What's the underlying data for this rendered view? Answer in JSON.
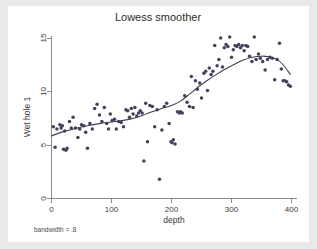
{
  "figure": {
    "title": "Lowess smoother",
    "note": "bandwidth = .8",
    "background": "#e9e9e9",
    "canvas_background": "#ffffff"
  },
  "chart_data": {
    "type": "scatter",
    "title": "Lowess smoother",
    "xlabel": "depth",
    "ylabel": "Wet hole 1",
    "note": "bandwidth = .8",
    "xlim": [
      0,
      400
    ],
    "ylim": [
      0,
      15.8
    ],
    "xticks": [
      0,
      100,
      200,
      300,
      400
    ],
    "yticks": [
      0,
      5,
      10,
      15
    ],
    "xtick_labels": [
      "0",
      "100",
      "200",
      "300",
      "400"
    ],
    "ytick_labels": [
      "0",
      "5",
      "10",
      "15"
    ],
    "grid": false,
    "legend": false,
    "marker_color": "#42425c",
    "line_color": "#3f3f55",
    "series": [
      {
        "name": "Wet hole 1 observations",
        "type": "scatter",
        "points": [
          [
            3,
            6.7
          ],
          [
            6,
            4.8
          ],
          [
            9,
            6.5
          ],
          [
            14,
            6.9
          ],
          [
            16,
            6.6
          ],
          [
            18,
            6.8
          ],
          [
            20,
            4.6
          ],
          [
            22,
            6.3
          ],
          [
            24,
            4.5
          ],
          [
            26,
            4.7
          ],
          [
            30,
            7.2
          ],
          [
            33,
            6.6
          ],
          [
            36,
            7.6
          ],
          [
            40,
            6.6
          ],
          [
            44,
            5.7
          ],
          [
            47,
            6.5
          ],
          [
            50,
            6.9
          ],
          [
            54,
            6.8
          ],
          [
            57,
            6.2
          ],
          [
            60,
            4.7
          ],
          [
            64,
            7.0
          ],
          [
            68,
            6.5
          ],
          [
            72,
            8.4
          ],
          [
            76,
            8.8
          ],
          [
            80,
            7.8
          ],
          [
            84,
            7.2
          ],
          [
            88,
            8.5
          ],
          [
            92,
            7.0
          ],
          [
            95,
            6.5
          ],
          [
            98,
            7.9
          ],
          [
            101,
            7.3
          ],
          [
            105,
            7.4
          ],
          [
            108,
            6.5
          ],
          [
            112,
            7.2
          ],
          [
            116,
            7.1
          ],
          [
            120,
            6.7
          ],
          [
            124,
            8.3
          ],
          [
            127,
            8.2
          ],
          [
            130,
            7.6
          ],
          [
            133,
            8.4
          ],
          [
            136,
            7.9
          ],
          [
            139,
            8.5
          ],
          [
            142,
            7.7
          ],
          [
            145,
            8.0
          ],
          [
            148,
            8.2
          ],
          [
            151,
            8.0
          ],
          [
            154,
            3.5
          ],
          [
            157,
            8.9
          ],
          [
            160,
            5.3
          ],
          [
            164,
            8.7
          ],
          [
            168,
            8.6
          ],
          [
            172,
            6.7
          ],
          [
            176,
            8.3
          ],
          [
            180,
            1.8
          ],
          [
            184,
            6.4
          ],
          [
            188,
            8.6
          ],
          [
            192,
            8.9
          ],
          [
            196,
            7.0
          ],
          [
            199,
            5.3
          ],
          [
            201,
            5.2
          ],
          [
            203,
            5.5
          ],
          [
            206,
            5.1
          ],
          [
            210,
            8.1
          ],
          [
            213,
            8.0
          ],
          [
            215,
            8.1
          ],
          [
            218,
            8.0
          ],
          [
            222,
            9.6
          ],
          [
            226,
            9.0
          ],
          [
            230,
            8.6
          ],
          [
            233,
            11.4
          ],
          [
            236,
            8.5
          ],
          [
            240,
            11.0
          ],
          [
            243,
            10.2
          ],
          [
            247,
            10.8
          ],
          [
            250,
            9.4
          ],
          [
            254,
            11.7
          ],
          [
            257,
            11.9
          ],
          [
            260,
            10.1
          ],
          [
            263,
            12.2
          ],
          [
            266,
            11.6
          ],
          [
            269,
            11.9
          ],
          [
            272,
            14.3
          ],
          [
            276,
            12.4
          ],
          [
            279,
            13.0
          ],
          [
            282,
            15.0
          ],
          [
            285,
            12.3
          ],
          [
            288,
            14.1
          ],
          [
            291,
            14.4
          ],
          [
            294,
            14.2
          ],
          [
            297,
            15.1
          ],
          [
            300,
            13.2
          ],
          [
            303,
            13.9
          ],
          [
            306,
            14.3
          ],
          [
            309,
            14.2
          ],
          [
            312,
            14.4
          ],
          [
            315,
            14.1
          ],
          [
            318,
            14.3
          ],
          [
            321,
            13.8
          ],
          [
            324,
            14.3
          ],
          [
            327,
            14.2
          ],
          [
            330,
            13.3
          ],
          [
            334,
            12.8
          ],
          [
            338,
            15.1
          ],
          [
            341,
            13.0
          ],
          [
            345,
            13.5
          ],
          [
            348,
            13.1
          ],
          [
            352,
            12.8
          ],
          [
            356,
            12.0
          ],
          [
            360,
            13.0
          ],
          [
            364,
            13.2
          ],
          [
            368,
            13.1
          ],
          [
            372,
            11.1
          ],
          [
            376,
            13.0
          ],
          [
            380,
            14.5
          ],
          [
            383,
            12.1
          ],
          [
            386,
            11.0
          ],
          [
            389,
            11.0
          ],
          [
            392,
            10.9
          ],
          [
            395,
            10.6
          ],
          [
            398,
            10.5
          ]
        ]
      },
      {
        "name": "lowess fit",
        "type": "line",
        "points": [
          [
            0,
            5.85
          ],
          [
            20,
            6.25
          ],
          [
            40,
            6.55
          ],
          [
            60,
            6.8
          ],
          [
            80,
            7.0
          ],
          [
            100,
            7.15
          ],
          [
            120,
            7.3
          ],
          [
            140,
            7.55
          ],
          [
            160,
            7.95
          ],
          [
            180,
            8.35
          ],
          [
            200,
            8.7
          ],
          [
            215,
            9.1
          ],
          [
            230,
            9.75
          ],
          [
            245,
            10.45
          ],
          [
            260,
            11.05
          ],
          [
            275,
            11.6
          ],
          [
            290,
            12.1
          ],
          [
            305,
            12.55
          ],
          [
            320,
            12.95
          ],
          [
            335,
            13.2
          ],
          [
            350,
            13.3
          ],
          [
            362,
            13.25
          ],
          [
            374,
            13.05
          ],
          [
            386,
            12.5
          ],
          [
            398,
            11.6
          ]
        ]
      }
    ]
  }
}
